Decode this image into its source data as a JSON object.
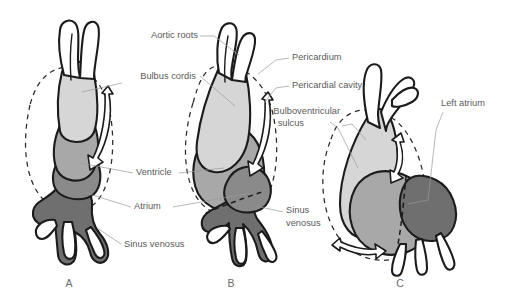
{
  "figure": {
    "panels": [
      {
        "id": "A",
        "letter": "A"
      },
      {
        "id": "B",
        "letter": "B"
      },
      {
        "id": "C",
        "letter": "C"
      }
    ],
    "labels": {
      "aortic_roots": "Aortic roots",
      "bulbus_cordis": "Bulbus cordis",
      "ventricle": "Ventricle",
      "atrium": "Atrium",
      "sinus_venosus_a": "Sinus venosus",
      "sinus_venosus_b_line1": "Sinus",
      "sinus_venosus_b_line2": "venosus",
      "pericardium": "Pericardium",
      "pericardial_cavity": "Pericardial cavity",
      "bulboventricular_sulcus_line1": "Bulboventricular",
      "bulboventricular_sulcus_line2": "sulcus",
      "left_atrium": "Left atrium"
    },
    "colors": {
      "background": "#ffffff",
      "outline": "#1b1b1b",
      "label_text": "#5b5b5b",
      "leader_line": "#9a9a9a",
      "bulbus_cordis_fill": "#d6d6d6",
      "ventricle_fill": "#a8a8a8",
      "atrium_fill": "#8a8a8a",
      "sinus_venosus_fill": "#6f6f6f",
      "vessel_fill": "#ffffff"
    }
  }
}
